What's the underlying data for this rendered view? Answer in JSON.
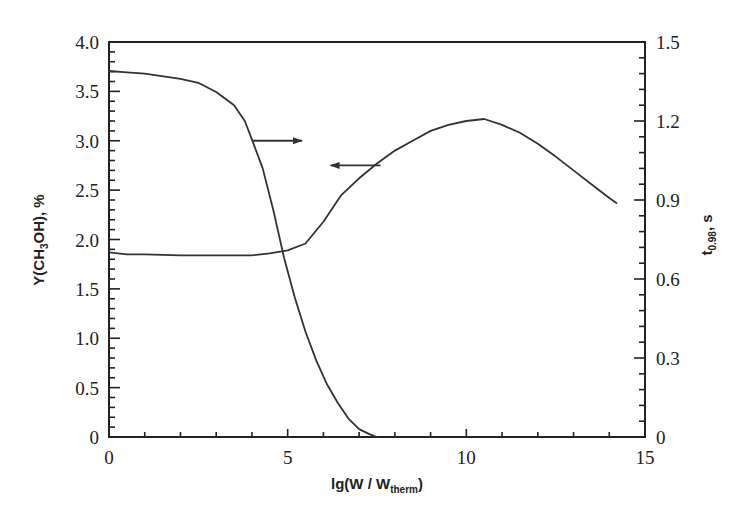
{
  "chart_data": {
    "type": "line",
    "title": "",
    "xlabel": "lg(W / W_therm)",
    "xlabel_main": "lg(W / W",
    "xlabel_sub": "therm",
    "xlabel_close": ")",
    "ylabel_left": "Y(CH3OH), %",
    "ylabel_left_parts": {
      "a": "Y(CH",
      "sub": "3",
      "b": "OH), %"
    },
    "ylabel_right": "t0.98, s",
    "ylabel_right_parts": {
      "a": "t",
      "sub": "0.98",
      "b": ", s"
    },
    "xlim": [
      0,
      15
    ],
    "ylim_left": [
      0,
      4.0
    ],
    "ylim_right": [
      0,
      1.5
    ],
    "x_ticks": [
      "0",
      "5",
      "10",
      "15"
    ],
    "x_tick_values": [
      0,
      5,
      10,
      15
    ],
    "y_left_ticks": [
      "0",
      "0.5",
      "1.0",
      "1.5",
      "2.0",
      "2.5",
      "3.0",
      "3.5",
      "4.0"
    ],
    "y_left_tick_values": [
      0,
      0.5,
      1.0,
      1.5,
      2.0,
      2.5,
      3.0,
      3.5,
      4.0
    ],
    "y_right_ticks": [
      "0",
      "0.3",
      "0.6",
      "0.9",
      "1.2",
      "1.5"
    ],
    "y_right_tick_values": [
      0,
      0.3,
      0.6,
      0.9,
      1.2,
      1.5
    ],
    "grid": false,
    "legend": "none (arrows indicate axis for each curve)",
    "series": [
      {
        "name": "Y(CH3OH), %",
        "axis": "left",
        "arrow": "left",
        "x": [
          0,
          0.5,
          1,
          2,
          3,
          4,
          4.5,
          5,
          5.5,
          6,
          6.5,
          7,
          7.5,
          8,
          8.5,
          9,
          9.5,
          10,
          10.5,
          11,
          11.5,
          12,
          12.5,
          13,
          13.5,
          14,
          14.2
        ],
        "values": [
          1.87,
          1.85,
          1.85,
          1.84,
          1.84,
          1.84,
          1.86,
          1.89,
          1.96,
          2.18,
          2.45,
          2.62,
          2.77,
          2.9,
          3.0,
          3.1,
          3.16,
          3.2,
          3.22,
          3.16,
          3.08,
          2.97,
          2.84,
          2.7,
          2.56,
          2.42,
          2.37
        ]
      },
      {
        "name": "t0.98, s",
        "axis": "right",
        "arrow": "right",
        "x": [
          0,
          0.5,
          1,
          2,
          2.5,
          3,
          3.5,
          3.8,
          4.0,
          4.3,
          4.6,
          4.9,
          5.2,
          5.5,
          5.8,
          6.1,
          6.4,
          6.7,
          7.0,
          7.3,
          7.5
        ],
        "values": [
          1.39,
          1.385,
          1.38,
          1.36,
          1.345,
          1.31,
          1.26,
          1.2,
          1.13,
          1.02,
          0.86,
          0.68,
          0.53,
          0.4,
          0.29,
          0.2,
          0.13,
          0.07,
          0.03,
          0.01,
          0.0
        ]
      }
    ],
    "annotations": [
      {
        "type": "arrow",
        "direction": "right",
        "from_series": "t0.98, s",
        "x_start": 4.0,
        "x_end": 5.4,
        "y_left": 3.0
      },
      {
        "type": "arrow",
        "direction": "left",
        "from_series": "Y(CH3OH), %",
        "x_start": 7.6,
        "x_end": 6.2,
        "y_left": 2.75
      }
    ]
  }
}
